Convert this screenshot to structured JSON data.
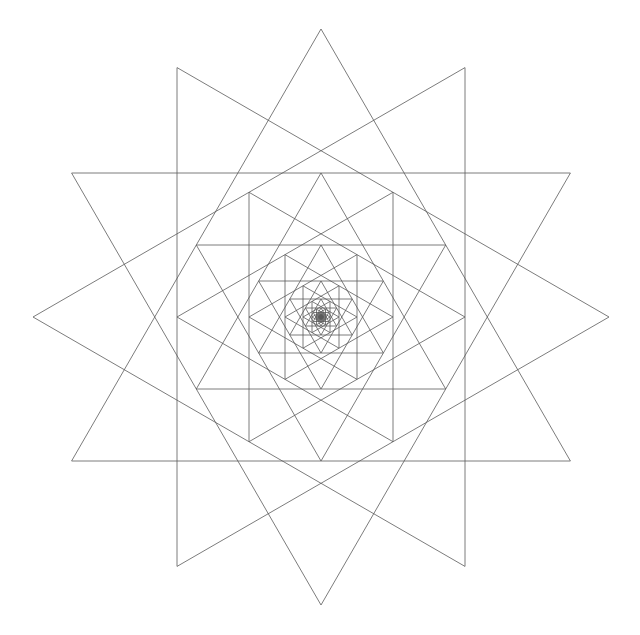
{
  "figure": {
    "center": [
      321,
      317
    ],
    "outer_radius": 288,
    "scale_ratio": 0.5,
    "levels": 9,
    "triangle_orientations_deg": [
      90,
      270,
      180,
      0
    ],
    "stroke_color": "#5a5a5a",
    "background_color": "#ffffff"
  },
  "clipped_text": {
    "visible": "partial descenders only (text cut off at top edge)"
  }
}
